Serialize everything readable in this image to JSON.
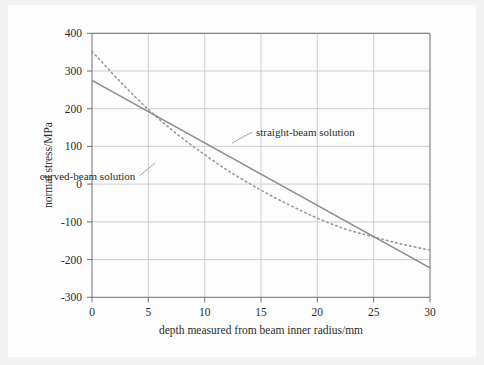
{
  "figure": {
    "background_color": "#fdfdfd",
    "page_background_color": "#f4f4f4",
    "frame_color": "#6e6e6e",
    "grid_color": "#c9c9c9"
  },
  "chart_data": {
    "type": "line",
    "title": "",
    "xlabel": "depth measured from beam inner radius/mm",
    "ylabel": "normal stress/MPa",
    "xlim": [
      0,
      30
    ],
    "ylim": [
      -300,
      400
    ],
    "xticks": [
      0,
      5,
      10,
      15,
      20,
      25,
      30
    ],
    "xtick_labels": [
      "0",
      "5",
      "10",
      "15",
      "20",
      "25",
      "30"
    ],
    "yticks": [
      -300,
      -200,
      -100,
      0,
      100,
      200,
      300,
      400
    ],
    "ytick_labels": [
      "-300",
      "-200",
      "-100",
      "0",
      "100",
      "200",
      "300",
      "400"
    ],
    "grid": true,
    "grid_axes": "both",
    "legend": "inline-annotations",
    "series": [
      {
        "name": "straight-beam solution",
        "style": "solid",
        "color": "#8a8a8a",
        "x": [
          0,
          5,
          10,
          15,
          20,
          25,
          30
        ],
        "values": [
          275,
          192,
          109,
          26,
          -57,
          -140,
          -222
        ]
      },
      {
        "name": "curved-beam solution",
        "style": "dotted",
        "color": "#9b9b9b",
        "x": [
          0,
          2.5,
          5,
          7.5,
          10,
          12.5,
          15,
          17.5,
          20,
          22.5,
          25,
          27.5,
          30
        ],
        "values": [
          352,
          272,
          198,
          134,
          78,
          28,
          -16,
          -55,
          -90,
          -119,
          -140,
          -159,
          -175
        ]
      }
    ],
    "annotations": [
      {
        "text": "straight-beam solution",
        "target_series": "straight-beam solution",
        "x": 14.2,
        "y": 138
      },
      {
        "text": "curved-beam solution",
        "target_series": "curved-beam solution",
        "x": 4.2,
        "y": 22
      }
    ]
  }
}
